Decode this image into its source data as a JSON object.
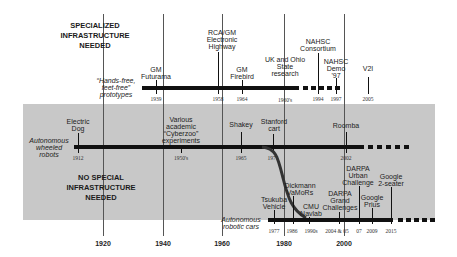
{
  "sections": {
    "top_heading": [
      "SPECIALIZED",
      "INFRASTRUCTURE",
      "NEEDED"
    ],
    "bottom_heading": [
      "NO SPECIAL",
      "INFRASTRUCTURE",
      "NEEDED"
    ]
  },
  "axis": {
    "ticks": [
      {
        "label": "1920",
        "x": 103
      },
      {
        "label": "1940",
        "x": 163
      },
      {
        "label": "1960",
        "x": 222
      },
      {
        "label": "1980",
        "x": 283
      },
      {
        "label": "2000",
        "x": 343
      }
    ]
  },
  "tracks": {
    "prototypes": {
      "label": [
        "“Hands-free,",
        "feet-free”",
        "prototypes"
      ],
      "events": [
        {
          "name": [
            "GM",
            "Futurama"
          ],
          "year": "1939"
        },
        {
          "name": [
            "RCA/GM",
            "Electronic",
            "Highway"
          ],
          "year": "1958"
        },
        {
          "name": [
            "GM",
            "Firebird"
          ],
          "year": "1964"
        },
        {
          "name": [
            "UK and Ohio",
            "State",
            "research"
          ],
          "year": "1960's"
        },
        {
          "name": [
            "NAHSC",
            "Consortium"
          ],
          "year": "1994"
        },
        {
          "name": [
            "NAHSC",
            "Demo",
            "'97"
          ],
          "year": "1997"
        },
        {
          "name": [
            "V2I"
          ],
          "year": "2005"
        }
      ]
    },
    "wheeled_robots": {
      "label": [
        "Autonomous",
        "wheeled",
        "robots"
      ],
      "events": [
        {
          "name": [
            "Electric",
            "Dog"
          ],
          "year": "1912"
        },
        {
          "name": [
            "Various",
            "academic",
            "“Cyberzoo”",
            "experiments"
          ],
          "year": "1950's"
        },
        {
          "name": [
            "Shakey"
          ],
          "year": "1965"
        },
        {
          "name": [
            "Stanford",
            "cart"
          ],
          "year": "1975"
        },
        {
          "name": [
            "Roomba"
          ],
          "year": "2002"
        }
      ]
    },
    "robotic_cars": {
      "label": [
        "Autonomous",
        "robotic cars"
      ],
      "events": [
        {
          "name": [
            "Tsukuba",
            "Vehicle"
          ],
          "year": "1977"
        },
        {
          "name": [
            "Dickmann",
            "VaMoRs"
          ],
          "year": "1986"
        },
        {
          "name": [
            "CMU",
            "Navlab"
          ],
          "year": "1990s"
        },
        {
          "name": [
            "DARPA",
            "Grand",
            "Challenges"
          ],
          "year": "2004 & 05"
        },
        {
          "name": [
            "DARPA",
            "Urban",
            "Challenge"
          ],
          "year": "07"
        },
        {
          "name": [
            "Google",
            "Prius"
          ],
          "year": "2009"
        },
        {
          "name": [
            "Google",
            "2-seater"
          ],
          "year": "2015"
        }
      ]
    }
  }
}
